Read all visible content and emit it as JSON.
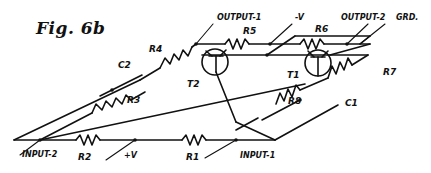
{
  "figure": {
    "title": "Fig. 6b"
  },
  "terminals": {
    "output_1": "OUTPUT-1",
    "minus_v": "-V",
    "output_2": "OUTPUT-2",
    "ground": "GRD.",
    "input_1": "INPUT-1",
    "input_2": "INPUT-2",
    "plus_v": "+V"
  },
  "components": {
    "resistors": [
      "R1",
      "R2",
      "R3",
      "R4",
      "R5",
      "R6",
      "R7",
      "R8"
    ],
    "capacitors": [
      "C1",
      "C2"
    ],
    "transistors": [
      "T1",
      "T2"
    ],
    "labels": {
      "R1": "R1",
      "R2": "R2",
      "R3": "R3",
      "R4": "R4",
      "R5": "R5",
      "R6": "R6",
      "R7": "R7",
      "R8": "R8",
      "C1": "C1",
      "C2": "C2",
      "T1": "T1",
      "T2": "T2"
    }
  },
  "colors": {
    "ink": "#111111",
    "paper": "#ffffff"
  }
}
